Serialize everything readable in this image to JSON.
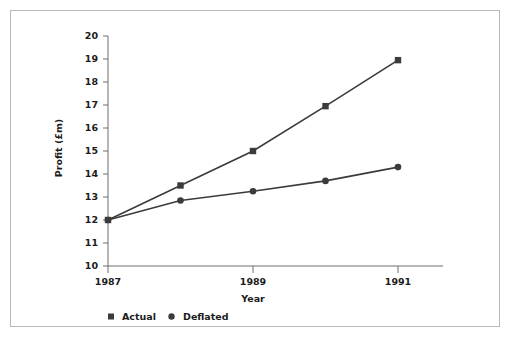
{
  "chart_data": {
    "type": "line",
    "title": "",
    "xlabel": "Year",
    "ylabel": "Profit (£m)",
    "x": [
      1987,
      1988,
      1989,
      1990,
      1991
    ],
    "categories": [
      "1987",
      "1988",
      "1989",
      "1990",
      "1991"
    ],
    "xtick_labels": [
      "1987",
      "1989",
      "1991"
    ],
    "xtick_values": [
      1987,
      1989,
      1991
    ],
    "ytick_labels": [
      "10",
      "11",
      "12",
      "13",
      "14",
      "15",
      "16",
      "17",
      "18",
      "19",
      "20"
    ],
    "ytick_values": [
      10,
      11,
      12,
      13,
      14,
      15,
      16,
      17,
      18,
      19,
      20
    ],
    "xlim": [
      1987,
      1991
    ],
    "ylim": [
      10,
      20
    ],
    "grid": false,
    "legend_position": "below-axis-left",
    "series": [
      {
        "name": "Actual",
        "marker": "square",
        "color": "#3b3b3b",
        "values": [
          12.0,
          13.5,
          15.0,
          16.95,
          18.95
        ]
      },
      {
        "name": "Deflated",
        "marker": "circle",
        "color": "#3b3b3b",
        "values": [
          12.0,
          12.85,
          13.25,
          13.7,
          14.3
        ]
      }
    ]
  },
  "legend": {
    "entries": [
      {
        "label": "Actual",
        "marker": "square"
      },
      {
        "label": "Deflated",
        "marker": "circle"
      }
    ]
  },
  "axes": {
    "y_title": "Profit (£m)",
    "x_title": "Year"
  },
  "colors": {
    "ink": "#3b3b3b",
    "axis": "#6f6f6f",
    "frame": "#b9b9b9",
    "background": "#ffffff"
  }
}
